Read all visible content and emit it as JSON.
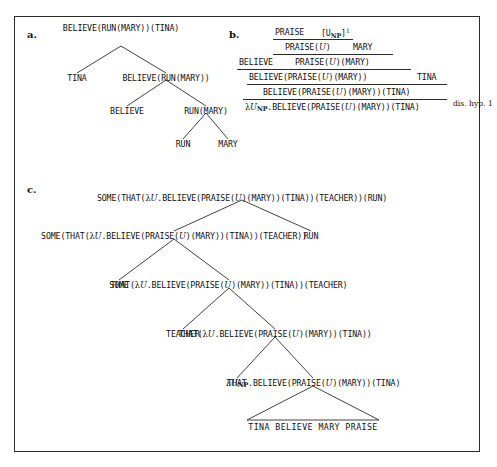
{
  "figure": {
    "panels": [
      {
        "id": "a",
        "label": "a."
      },
      {
        "id": "b",
        "label": "b."
      },
      {
        "id": "c",
        "label": "c."
      }
    ]
  },
  "tree_a": {
    "nodes": [
      {
        "id": "a-root",
        "text": "BELIEVE(RUN(MARY))(TINA)"
      },
      {
        "id": "a-l1",
        "text": "TINA"
      },
      {
        "id": "a-r1",
        "text": "BELIEVE(RUN(MARY))"
      },
      {
        "id": "a-l2",
        "text": "BELIEVE"
      },
      {
        "id": "a-r2",
        "text": "RUN(MARY)"
      },
      {
        "id": "a-l3",
        "text": "RUN"
      },
      {
        "id": "a-r3",
        "text": "MARY"
      }
    ]
  },
  "proof_b": {
    "hypothesis": {
      "praise": "PRAISE",
      "discharged": "[U",
      "discharged_sub": "NP",
      "discharged_close": "]",
      "discharged_sup": "1"
    },
    "lines": [
      {
        "id": "b-line1-left",
        "text": "PRAISE("
      },
      {
        "id": "b-line1-var",
        "text": "U"
      },
      {
        "id": "b-line1-right",
        "text": ")"
      },
      {
        "id": "b-line1-arg",
        "text": "MARY"
      },
      {
        "id": "b-line2-a",
        "text": "PRAISE("
      },
      {
        "id": "b-line2-b",
        "text": ")(MARY)"
      },
      {
        "id": "b-believe",
        "text": "BELIEVE"
      },
      {
        "id": "b-line3-a",
        "text": "BELIEVE(PRAISE("
      },
      {
        "id": "b-line3-b",
        "text": ")(MARY))"
      },
      {
        "id": "b-tina",
        "text": "TINA"
      },
      {
        "id": "b-line4-a",
        "text": "BELIEVE(PRAISE("
      },
      {
        "id": "b-line4-b",
        "text": ")(MARY))(TINA)"
      },
      {
        "id": "b-line5-lam",
        "text": "λ"
      },
      {
        "id": "b-line5-var",
        "text": "U"
      },
      {
        "id": "b-line5-sub",
        "text": "NP"
      },
      {
        "id": "b-line5-a",
        "text": ".BELIEVE(PRAISE("
      },
      {
        "id": "b-line5-b",
        "text": ")(MARY))(TINA)"
      }
    ],
    "side_label": "dis. hyp. 1",
    "var_symbol": "U"
  },
  "tree_c": {
    "nodes": [
      {
        "id": "c-root-a",
        "text": "SOME(THAT(",
        "lam": "λ",
        "var": "U",
        "mid": ".BELIEVE(PRAISE(",
        "var2": "U",
        "tail": ")(MARY))(TINA))(TEACHER))(RUN)"
      },
      {
        "id": "c-l1",
        "text": "SOME(THAT(",
        "lam": "λ",
        "var": "U",
        "mid": ".BELIEVE(PRAISE(",
        "var2": "U",
        "tail": ")(MARY))(TINA))(TEACHER))"
      },
      {
        "id": "c-r1",
        "text": "RUN"
      },
      {
        "id": "c-l2",
        "text": "SOME"
      },
      {
        "id": "c-r2",
        "text": "THAT(",
        "lam": "λ",
        "var": "U",
        "mid": ".BELIEVE(PRAISE(",
        "var2": "U",
        "tail": ")(MARY))(TINA))(TEACHER)"
      },
      {
        "id": "c-l3",
        "text": "TEACHER"
      },
      {
        "id": "c-r3",
        "text": "THAT(",
        "lam": "λ",
        "var": "U",
        "mid": ".BELIEVE(PRAISE(",
        "var2": "U",
        "tail": ")(MARY))(TINA))"
      },
      {
        "id": "c-l4",
        "text": "THAT"
      },
      {
        "id": "c-r4",
        "lam": "λ",
        "var": "U",
        "sub": "NP",
        "mid": ".BELIEVE(PRAISE(",
        "var2": "U",
        "tail": ")(MARY))(TINA)"
      },
      {
        "id": "c-terminal",
        "text": "TINA BELIEVE MARY PRAISE"
      }
    ]
  }
}
